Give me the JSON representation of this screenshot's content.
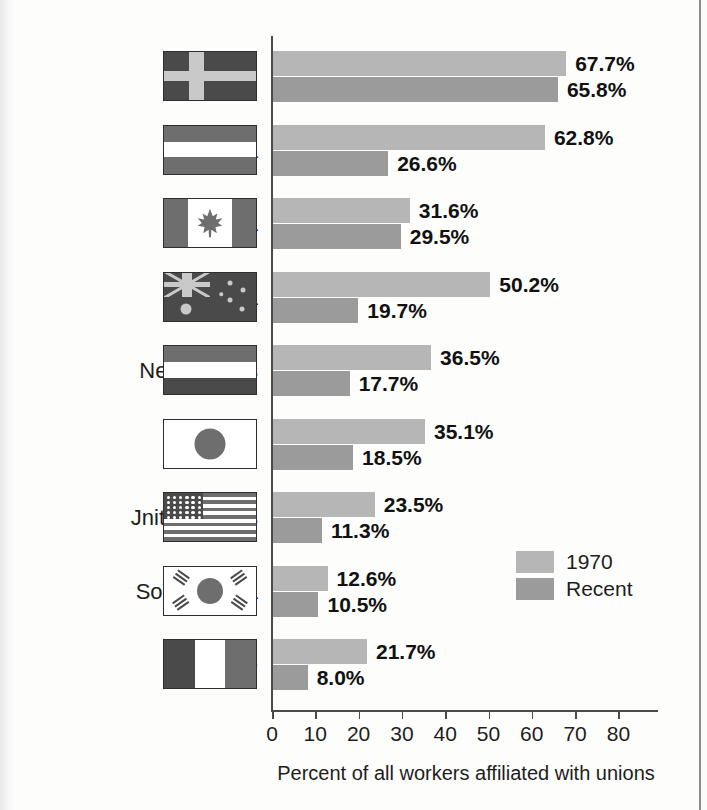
{
  "chart_data": {
    "type": "bar",
    "orientation": "horizontal",
    "title": "",
    "xlabel": "Percent of all workers affiliated with unions",
    "ylabel": "",
    "xlim": [
      0,
      85
    ],
    "xticks": [
      0,
      10,
      20,
      30,
      40,
      50,
      60,
      70,
      80
    ],
    "xtick_labels": [
      "0",
      "10",
      "20",
      "30",
      "40",
      "50",
      "60",
      "70",
      "80"
    ],
    "grid": false,
    "legend_position": "inside-right",
    "categories": [
      "Sweden",
      "Austria",
      "Canada",
      "Australia",
      "Netherlands",
      "Japan",
      "United States",
      "South Korea",
      "France"
    ],
    "series": [
      {
        "name": "1970",
        "color": "#b6b6b6",
        "values": [
          67.7,
          62.8,
          31.6,
          50.2,
          36.5,
          35.1,
          23.5,
          12.6,
          21.7
        ]
      },
      {
        "name": "Recent",
        "color": "#9b9b9b",
        "values": [
          65.8,
          26.6,
          29.5,
          19.7,
          17.7,
          18.5,
          11.3,
          10.5,
          8.0
        ]
      }
    ],
    "value_labels": {
      "1970": [
        "67.7%",
        "62.8%",
        "31.6%",
        "50.2%",
        "36.5%",
        "35.1%",
        "23.5%",
        "12.6%",
        "21.7%"
      ],
      "Recent": [
        "65.8%",
        "26.6%",
        "29.5%",
        "19.7%",
        "17.7%",
        "18.5%",
        "11.3%",
        "10.5%",
        "8.0%"
      ]
    }
  },
  "rows": [
    {
      "country": "Sweden",
      "display_label": "Sweden",
      "flag": "flag-sweden",
      "old": 67.7,
      "recent": 65.8,
      "old_label": "67.7%",
      "recent_label": "65.8%"
    },
    {
      "country": "Austria",
      "display_label": "Austria",
      "flag": "flag-austria",
      "old": 62.8,
      "recent": 26.6,
      "old_label": "62.8%",
      "recent_label": "26.6%"
    },
    {
      "country": "Canada",
      "display_label": "Canada",
      "flag": "flag-canada",
      "old": 31.6,
      "recent": 29.5,
      "old_label": "31.6%",
      "recent_label": "29.5%"
    },
    {
      "country": "Australia",
      "display_label": "Australia",
      "flag": "flag-australia",
      "old": 50.2,
      "recent": 19.7,
      "old_label": "50.2%",
      "recent_label": "19.7%"
    },
    {
      "country": "Netherlands",
      "display_label": "Netherlands",
      "flag": "flag-netherlands",
      "old": 36.5,
      "recent": 17.7,
      "old_label": "36.5%",
      "recent_label": "17.7%"
    },
    {
      "country": "Japan",
      "display_label": "Japan",
      "flag": "flag-japan",
      "old": 35.1,
      "recent": 18.5,
      "old_label": "35.1%",
      "recent_label": "18.5%"
    },
    {
      "country": "United States",
      "display_label": "Jnited States",
      "flag": "flag-united-states",
      "old": 23.5,
      "recent": 11.3,
      "old_label": "23.5%",
      "recent_label": "11.3%"
    },
    {
      "country": "South Korea",
      "display_label": "South Korea",
      "flag": "flag-south-korea",
      "old": 12.6,
      "recent": 10.5,
      "old_label": "12.6%",
      "recent_label": "10.5%"
    },
    {
      "country": "France",
      "display_label": "France",
      "flag": "flag-france",
      "old": 21.7,
      "recent": 8.0,
      "old_label": "21.7%",
      "recent_label": "8.0%"
    }
  ],
  "legend": {
    "items": [
      {
        "label": "1970",
        "color": "#b6b6b6"
      },
      {
        "label": "Recent",
        "color": "#9b9b9b"
      }
    ]
  },
  "axis": {
    "title": "Percent of all workers affiliated with unions",
    "ticks": [
      "0",
      "10",
      "20",
      "30",
      "40",
      "50",
      "60",
      "70",
      "80"
    ]
  },
  "colors": {
    "bar_1970": "#b6b6b6",
    "bar_recent": "#9b9b9b",
    "axis": "#4a4a4a",
    "text": "#1d1d1d",
    "flag_dark": "#4a4a4a",
    "flag_mid": "#6e6e6e",
    "flag_light": "#c9c9c9"
  }
}
